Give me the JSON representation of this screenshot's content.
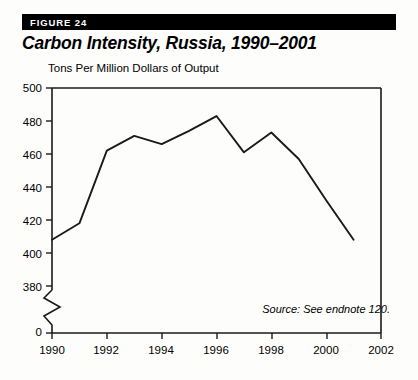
{
  "figure": {
    "label": "FIGURE 24",
    "title": "Carbon Intensity, Russia, 1990–2001"
  },
  "source_note": "Source: See endnote 120.",
  "colors": {
    "line": "#1a1a1a",
    "axis": "#1a1a1a",
    "bar_background": "#000000",
    "bar_text": "#ffffff",
    "page_background": "#fdfdfb"
  },
  "chart_data": {
    "type": "line",
    "title": "Carbon Intensity, Russia, 1990–2001",
    "subtitle": "",
    "xlabel": "",
    "ylabel": "Tons Per Million Dollars of Output",
    "x": [
      1990,
      1991,
      1992,
      1993,
      1994,
      1995,
      1996,
      1997,
      1998,
      1999,
      2000,
      2001
    ],
    "values": [
      408,
      418,
      462,
      471,
      466,
      474,
      483,
      461,
      473,
      457,
      432,
      408
    ],
    "series": [
      {
        "name": "Carbon Intensity",
        "values": [
          408,
          418,
          462,
          471,
          466,
          474,
          483,
          461,
          473,
          457,
          432,
          408
        ]
      }
    ],
    "xlim": [
      1990,
      2002
    ],
    "ylim": [
      380,
      500
    ],
    "y_axis_break": true,
    "y_break_from": 0,
    "y_break_to": 380,
    "yticks": [
      500,
      480,
      460,
      440,
      420,
      400,
      380,
      0
    ],
    "ytick_labels": [
      "500",
      "480",
      "460",
      "440",
      "420",
      "400",
      "380",
      "0"
    ],
    "xticks": [
      1990,
      1992,
      1994,
      1996,
      1998,
      2000,
      2002
    ],
    "xtick_labels": [
      "1990",
      "1992",
      "1994",
      "1996",
      "1998",
      "2000",
      "2002"
    ],
    "grid": false,
    "legend": false,
    "legend_position": "none",
    "annotations": [
      "Source: See endnote 120."
    ]
  }
}
